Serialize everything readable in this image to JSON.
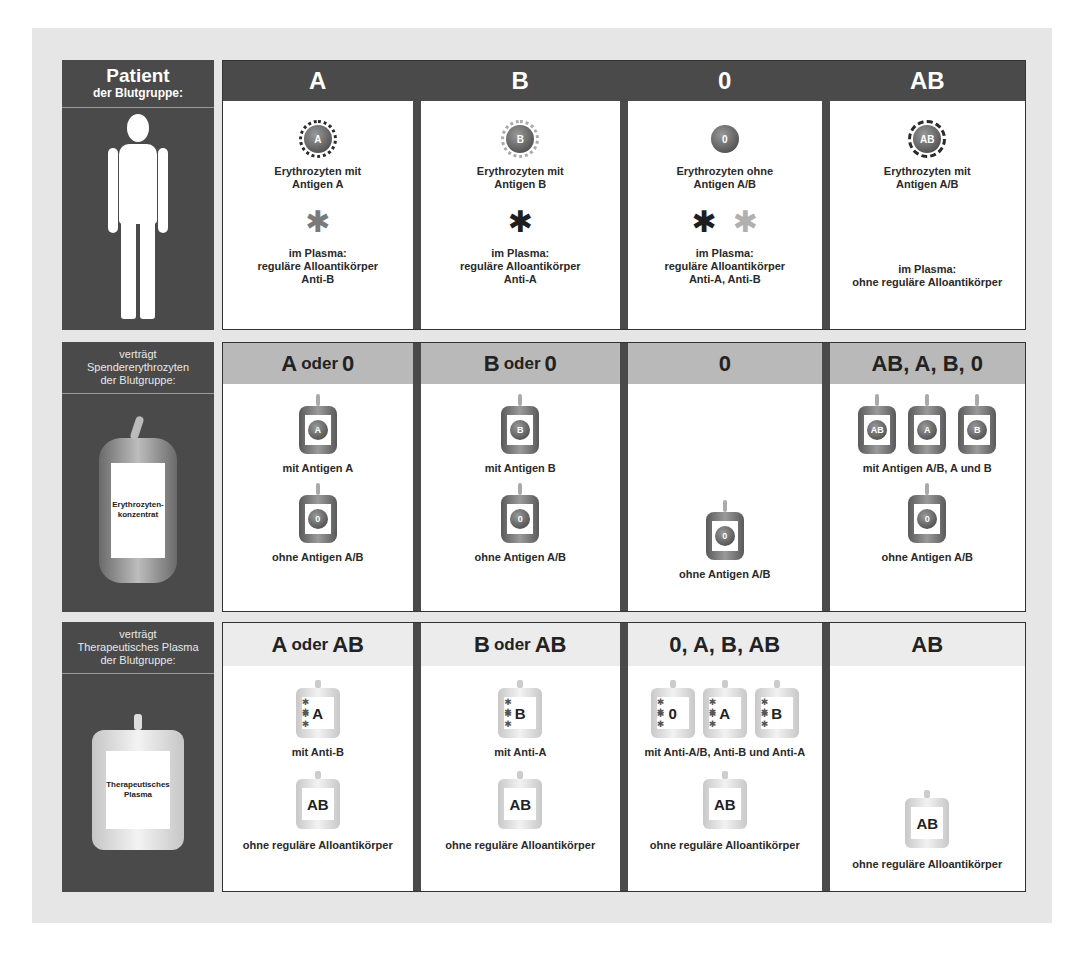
{
  "side": {
    "patient": {
      "title": "Patient",
      "subtitle": "der Blutgruppe:"
    },
    "rbc": {
      "line1": "verträgt",
      "line2": "Spendererythrozyten",
      "line3": "der Blutgruppe:",
      "bag_label_1": "Erythrozyten-",
      "bag_label_2": "konzentrat"
    },
    "plasma": {
      "line1": "verträgt",
      "line2": "Therapeutisches Plasma",
      "line3": "der Blutgruppe:",
      "bag_label_1": "Therapeutisches",
      "bag_label_2": "Plasma"
    }
  },
  "patient_row": [
    {
      "group": "A",
      "cell_label": "A",
      "cell_text_1": "Erythrozyten mit",
      "cell_text_2": "Antigen A",
      "plasma_1": "im Plasma:",
      "plasma_2": "reguläre Alloantikörper",
      "plasma_3": "Anti-B"
    },
    {
      "group": "B",
      "cell_label": "B",
      "cell_text_1": "Erythrozyten mit",
      "cell_text_2": "Antigen B",
      "plasma_1": "im Plasma:",
      "plasma_2": "reguläre Alloantikörper",
      "plasma_3": "Anti-A"
    },
    {
      "group": "0",
      "cell_label": "0",
      "cell_text_1": "Erythrozyten ohne",
      "cell_text_2": "Antigen A/B",
      "plasma_1": "im Plasma:",
      "plasma_2": "reguläre Alloantikörper",
      "plasma_3": "Anti-A, Anti-B"
    },
    {
      "group": "AB",
      "cell_label": "AB",
      "cell_text_1": "Erythrozyten mit",
      "cell_text_2": "Antigen A/B",
      "plasma_1": "im Plasma:",
      "plasma_2": "ohne reguläre Alloantikörper"
    }
  ],
  "rbc_row": [
    {
      "h1": "A",
      "h_mid": "oder",
      "h2": "0",
      "bag1": "A",
      "label1": "mit Antigen A",
      "bag2": "0",
      "label2": "ohne Antigen A/B"
    },
    {
      "h1": "B",
      "h_mid": "oder",
      "h2": "0",
      "bag1": "B",
      "label1": "mit Antigen B",
      "bag2": "0",
      "label2": "ohne Antigen A/B"
    },
    {
      "h": "0",
      "bag2": "0",
      "label2": "ohne Antigen A/B"
    },
    {
      "h": "AB, A, B, 0",
      "bags": [
        "AB",
        "A",
        "B"
      ],
      "label1": "mit Antigen A/B, A und B",
      "bag2": "0",
      "label2": "ohne Antigen A/B"
    }
  ],
  "plasma_row": [
    {
      "h1": "A",
      "h_mid": "oder",
      "h2": "AB",
      "bag1": "A",
      "label1": "mit Anti-B",
      "bag2": "AB",
      "label2": "ohne reguläre Alloantikörper"
    },
    {
      "h1": "B",
      "h_mid": "oder",
      "h2": "AB",
      "bag1": "B",
      "label1": "mit Anti-A",
      "bag2": "AB",
      "label2": "ohne reguläre Alloantikörper"
    },
    {
      "h": "0, A, B, AB",
      "bags": [
        "0",
        "A",
        "B"
      ],
      "label1": "mit Anti-A/B, Anti-B und Anti-A",
      "bag2": "AB",
      "label2": "ohne reguläre Alloantikörper"
    },
    {
      "h": "AB",
      "bag2": "AB",
      "label2": "ohne reguläre Alloantikörper"
    }
  ],
  "icons": {
    "antibody": "✱"
  },
  "colors": {
    "dark_panel": "#4a4a4a",
    "rbc_header": "#b9b9b9",
    "plasma_header": "#ececec",
    "background": "#e6e6e6"
  }
}
